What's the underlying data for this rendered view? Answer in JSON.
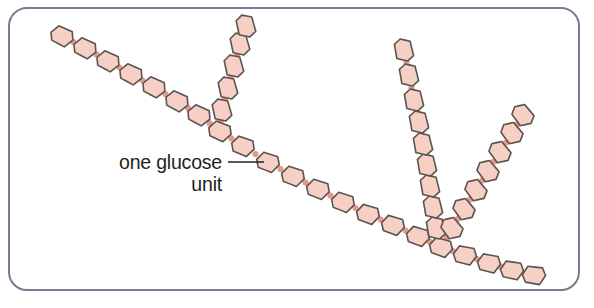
{
  "figure": {
    "frame": {
      "border_color": "#7b7a91",
      "border_width": 2,
      "corner_radius": 18,
      "background": "#ffffff",
      "x": 9,
      "y": 8,
      "width": 570,
      "height": 282
    }
  },
  "annotation": {
    "line1": "one glucose",
    "line2": "unit",
    "text_color": "#231f20",
    "leader": {
      "color": "#231f20",
      "x1": 228,
      "y1": 162,
      "x2": 264,
      "y2": 162
    },
    "line1_x": 222,
    "line1_y": 169,
    "line2_x": 222,
    "line2_y": 191
  },
  "style": {
    "unit_fill": "#f6cfc5",
    "unit_stroke": "#59544f",
    "unit_stroke_width": 1.6,
    "bond_fill": "#e8988a",
    "bond_radius": 3.1,
    "unit_rx": 11.5,
    "unit_ry": 8.5
  },
  "chart_data": {
    "type": "diagram",
    "title": "one glucose unit",
    "legend": [
      "glucose unit",
      "glycosidic bond"
    ],
    "chains": [
      {
        "name": "main-backbone",
        "unit_count": 21,
        "start": [
          62,
          36
        ],
        "end": [
          530,
          274
        ],
        "units": [
          {
            "x": 62,
            "y": 36,
            "a": -152
          },
          {
            "x": 85,
            "y": 48,
            "a": -152
          },
          {
            "x": 108,
            "y": 61,
            "a": -152
          },
          {
            "x": 131,
            "y": 74,
            "a": -152
          },
          {
            "x": 154,
            "y": 87,
            "a": -152
          },
          {
            "x": 177,
            "y": 101,
            "a": -152
          },
          {
            "x": 199,
            "y": 115,
            "a": -152
          },
          {
            "x": 220,
            "y": 131,
            "a": -155
          },
          {
            "x": 243,
            "y": 146,
            "a": -157
          },
          {
            "x": 268,
            "y": 162,
            "a": -158
          },
          {
            "x": 293,
            "y": 176,
            "a": -158
          },
          {
            "x": 318,
            "y": 189,
            "a": -158
          },
          {
            "x": 343,
            "y": 202,
            "a": -158
          },
          {
            "x": 368,
            "y": 214,
            "a": -160
          },
          {
            "x": 393,
            "y": 225,
            "a": -160
          },
          {
            "x": 418,
            "y": 236,
            "a": -160
          },
          {
            "x": 441,
            "y": 247,
            "a": -160
          },
          {
            "x": 465,
            "y": 255,
            "a": -166
          },
          {
            "x": 489,
            "y": 263,
            "a": -166
          },
          {
            "x": 512,
            "y": 270,
            "a": -168
          },
          {
            "x": 534,
            "y": 275,
            "a": -170
          }
        ]
      },
      {
        "name": "branch-upper-left",
        "unit_count": 5,
        "branch_from": [
          220,
          131
        ],
        "units": [
          {
            "x": 222,
            "y": 110,
            "a": -102
          },
          {
            "x": 228,
            "y": 88,
            "a": -102
          },
          {
            "x": 234,
            "y": 66,
            "a": -102
          },
          {
            "x": 240,
            "y": 44,
            "a": -102
          },
          {
            "x": 246,
            "y": 26,
            "a": -102
          }
        ]
      },
      {
        "name": "branch-center-vertical",
        "unit_count": 9,
        "branch_from": [
          441,
          247
        ],
        "units": [
          {
            "x": 436,
            "y": 228,
            "a": -100
          },
          {
            "x": 433,
            "y": 207,
            "a": -100
          },
          {
            "x": 430,
            "y": 186,
            "a": -100
          },
          {
            "x": 427,
            "y": 165,
            "a": -100
          },
          {
            "x": 423,
            "y": 144,
            "a": -100
          },
          {
            "x": 419,
            "y": 122,
            "a": -100
          },
          {
            "x": 414,
            "y": 100,
            "a": -100
          },
          {
            "x": 409,
            "y": 75,
            "a": -100
          },
          {
            "x": 404,
            "y": 50,
            "a": -100
          }
        ]
      },
      {
        "name": "branch-upper-right",
        "unit_count": 7,
        "branch_from": [
          441,
          247
        ],
        "units": [
          {
            "x": 452,
            "y": 228,
            "a": -126
          },
          {
            "x": 464,
            "y": 209,
            "a": -126
          },
          {
            "x": 476,
            "y": 190,
            "a": -126
          },
          {
            "x": 488,
            "y": 171,
            "a": -126
          },
          {
            "x": 500,
            "y": 152,
            "a": -126
          },
          {
            "x": 512,
            "y": 133,
            "a": -126
          },
          {
            "x": 523,
            "y": 115,
            "a": -126
          }
        ]
      }
    ]
  }
}
